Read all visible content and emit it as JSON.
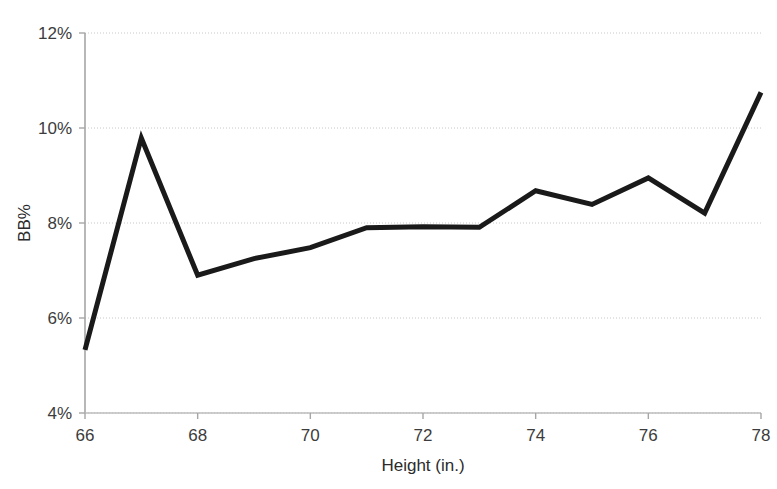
{
  "chart_data": {
    "type": "line",
    "title": "",
    "xlabel": "Height (in.)",
    "ylabel": "BB%",
    "x": [
      66,
      67,
      68,
      69,
      70,
      71,
      72,
      73,
      74,
      75,
      76,
      77,
      78
    ],
    "values": [
      5.33,
      9.79,
      6.9,
      7.25,
      7.48,
      7.9,
      7.92,
      7.91,
      8.68,
      8.39,
      8.95,
      8.21,
      10.75
    ],
    "series": [
      {
        "name": "BB%",
        "values": [
          5.33,
          9.79,
          6.9,
          7.25,
          7.48,
          7.9,
          7.92,
          7.91,
          8.68,
          8.39,
          8.95,
          8.21,
          10.75
        ]
      }
    ],
    "xlim": [
      66,
      78
    ],
    "ylim": [
      4,
      12
    ],
    "xticks": [
      66,
      68,
      70,
      72,
      74,
      76,
      78
    ],
    "xtick_labels": [
      "66",
      "68",
      "70",
      "72",
      "74",
      "76",
      "78"
    ],
    "yticks": [
      4,
      6,
      8,
      10,
      12
    ],
    "ytick_labels": [
      "4%",
      "6%",
      "8%",
      "10%",
      "12%"
    ],
    "grid": true,
    "grid_axis": "y",
    "legend": false,
    "legend_position": "none",
    "line_color": "#1a1a1a",
    "line_width": 5,
    "grid_color": "#c8c8c8",
    "axis_color": "#a6a6a6",
    "background_color": "#ffffff",
    "markers": false
  },
  "axis": {
    "y_label": "BB%",
    "x_label": "Height (in.)",
    "y_ticks": [
      "12%",
      "10%",
      "8%",
      "6%",
      "4%"
    ],
    "x_ticks": [
      "66",
      "68",
      "70",
      "72",
      "74",
      "76",
      "78"
    ]
  }
}
